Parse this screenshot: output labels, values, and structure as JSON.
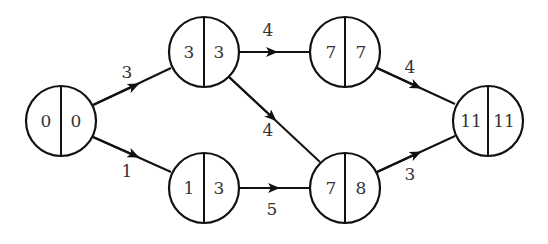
{
  "diagram": {
    "type": "activity-network",
    "colors": {
      "stroke": "#111111",
      "text": "#333333",
      "background": "#ffffff"
    },
    "nodes": [
      {
        "id": "n1",
        "left": "0",
        "right": "0",
        "cx": 61,
        "cy": 121
      },
      {
        "id": "n2",
        "left": "3",
        "right": "3",
        "cx": 204,
        "cy": 52
      },
      {
        "id": "n3",
        "left": "1",
        "right": "3",
        "cx": 204,
        "cy": 188
      },
      {
        "id": "n4",
        "left": "7",
        "right": "7",
        "cx": 345,
        "cy": 52
      },
      {
        "id": "n5",
        "left": "7",
        "right": "8",
        "cx": 345,
        "cy": 188
      },
      {
        "id": "n6",
        "left": "11",
        "right": "11",
        "cx": 488,
        "cy": 121
      }
    ],
    "edges": [
      {
        "from": "n1",
        "to": "n2",
        "weight": "3"
      },
      {
        "from": "n1",
        "to": "n3",
        "weight": "1"
      },
      {
        "from": "n2",
        "to": "n4",
        "weight": "4"
      },
      {
        "from": "n2",
        "to": "n5",
        "weight": "4"
      },
      {
        "from": "n3",
        "to": "n5",
        "weight": "5"
      },
      {
        "from": "n4",
        "to": "n6",
        "weight": "4"
      },
      {
        "from": "n5",
        "to": "n6",
        "weight": "3"
      }
    ]
  }
}
